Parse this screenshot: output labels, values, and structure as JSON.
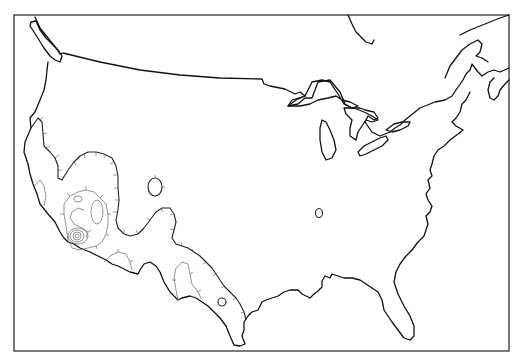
{
  "map": {
    "subject": "Contiguous United States outline map with contour lines",
    "colors": {
      "background": "#ffffff",
      "coastline": "#111111",
      "main_contour": "#222222",
      "inner_contour": "#777777",
      "frame": "#222222"
    },
    "features": [
      "frame-border",
      "us-coastline-and-borders",
      "great-lakes",
      "southwest-hachured-contour-region",
      "nested-concentric-contours-southern-california",
      "isolated-contour-ellipse-utah",
      "isolated-contour-ellipse-missouri",
      "isolated-contour-ellipse-texas"
    ]
  }
}
